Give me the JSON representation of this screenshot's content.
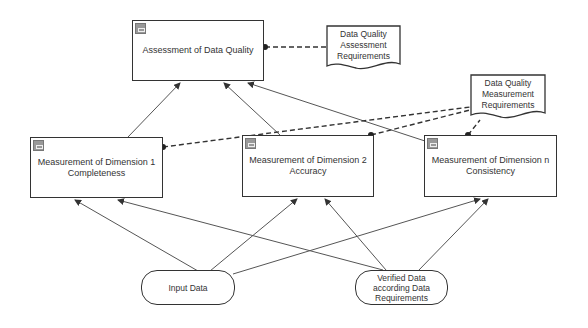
{
  "nodes": {
    "assessment": {
      "label": "Assessment of Data Quality"
    },
    "dim1": {
      "line1": "Measurement of Dimension 1",
      "line2": "Completeness"
    },
    "dim2": {
      "line1": "Measurement of Dimension 2",
      "line2": "Accuracy"
    },
    "dimn": {
      "line1": "Measurement of Dimension n",
      "line2": "Consistency"
    },
    "assess_req": {
      "line1": "Data Quality",
      "line2": "Assessment",
      "line3": "Requirements"
    },
    "meas_req": {
      "line1": "Data Quality",
      "line2": "Measurement",
      "line3": "Requirements"
    },
    "input": {
      "label": "Input Data"
    },
    "verified": {
      "line1": "Verified Data",
      "line2": "according Data",
      "line3": "Requirements"
    }
  },
  "colors": {
    "line": "#444444",
    "icon": "#999999"
  }
}
